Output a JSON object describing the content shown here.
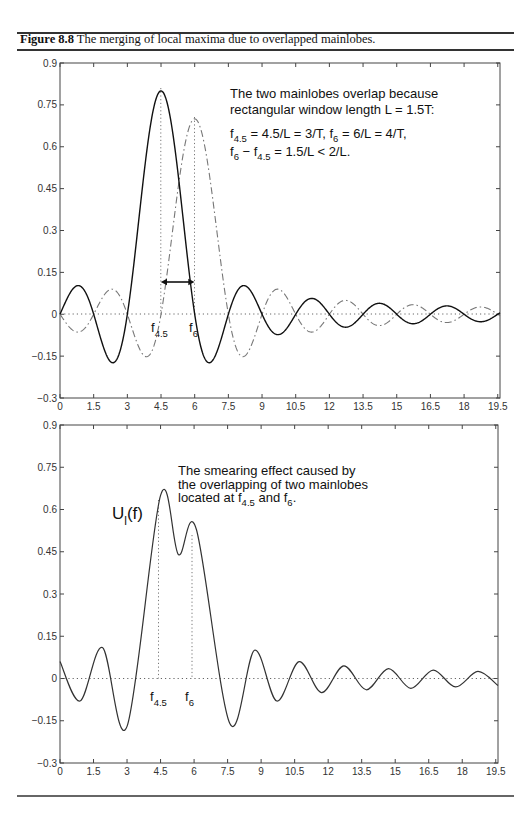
{
  "caption": {
    "label": "Figure 8.8",
    "text": " The merging of local maxima due to overlapped mainlobes."
  },
  "top_plot": {
    "annotation_lines": [
      "The two mainlobes overlap because",
      "rectangular window length L = 1.5T:"
    ],
    "eq1": {
      "a": "f",
      "a_sub": "4.5",
      "b": " = 4.5/L = 3/T, f",
      "b_sub": "6",
      "c": " = 6/L = 4/T,"
    },
    "eq2": {
      "a": "f",
      "a_sub": "6",
      "b": " − f",
      "b_sub": "4.5",
      "c": " = 1.5/L < 2/L."
    },
    "marker1": {
      "f": "f",
      "sub": "4.5"
    },
    "marker2": {
      "f": "f",
      "sub": "6"
    }
  },
  "bottom_plot": {
    "annotation_lines": [
      "The smearing effect caused by",
      "the overlapping of two mainlobes"
    ],
    "annotation_line3": {
      "a": "located at f",
      "a_sub": "4.5",
      "b": " and f",
      "b_sub": "6",
      "c": "."
    },
    "curve_label": {
      "u": "U",
      "sub": "l",
      "rest": "(f)"
    },
    "marker1": {
      "f": "f",
      "sub": "4.5"
    },
    "marker2": {
      "f": "f",
      "sub": "6"
    }
  },
  "chart_data": [
    {
      "type": "line",
      "title": "",
      "xlabel": "",
      "ylabel": "",
      "xlim": [
        0,
        19.6
      ],
      "ylim": [
        -0.3,
        0.9
      ],
      "xticks": [
        "0",
        "1.5",
        "3",
        "4.5",
        "6",
        "7.5",
        "9",
        "10.5",
        "12",
        "13.5",
        "15",
        "16.5",
        "18",
        "19.5"
      ],
      "yticks": [
        "-0.3",
        "-0.15",
        "0",
        "0.15",
        "0.3",
        "0.45",
        "0.6",
        "0.75",
        "0.9"
      ],
      "grid": false,
      "series": [
        {
          "name": "mainlobe at f4.5",
          "style": "solid",
          "center": 4.5,
          "peak": 0.8,
          "zero_spacing": 1.5,
          "notable_points": [
            [
              0,
              0.06
            ],
            [
              1.0,
              -0.07
            ],
            [
              2.0,
              0.1
            ],
            [
              3.0,
              -0.17
            ],
            [
              4.5,
              0.8
            ],
            [
              6.0,
              -0.17
            ],
            [
              7.0,
              0.1
            ],
            [
              8.0,
              -0.07
            ]
          ]
        },
        {
          "name": "mainlobe at f6",
          "style": "dash-dot",
          "center": 6.0,
          "peak": 0.7,
          "zero_spacing": 1.5,
          "notable_points": [
            [
              3.5,
              0.09
            ],
            [
              4.5,
              -0.15
            ],
            [
              6.0,
              0.7
            ],
            [
              7.5,
              -0.15
            ],
            [
              8.5,
              0.09
            ]
          ]
        }
      ],
      "annotations": [
        "The two mainlobes overlap because rectangular window length L = 1.5T:",
        "f4.5 = 4.5/L = 3/T, f6 = 6/L = 4/T,",
        "f6 - f4.5 = 1.5/L < 2/L."
      ]
    },
    {
      "type": "line",
      "title": "",
      "xlabel": "",
      "ylabel": "",
      "xlim": [
        0,
        19.6
      ],
      "ylim": [
        -0.3,
        0.9
      ],
      "xticks": [
        "0",
        "1.5",
        "3",
        "4.5",
        "6",
        "7.5",
        "9",
        "10.5",
        "12",
        "13.5",
        "15",
        "16.5",
        "18",
        "19.5"
      ],
      "yticks": [
        "-0.3",
        "-0.15",
        "0",
        "0.15",
        "0.3",
        "0.45",
        "0.6",
        "0.75",
        "0.9"
      ],
      "grid": false,
      "series": [
        {
          "name": "U_l(f)",
          "style": "solid",
          "points": [
            [
              0,
              0.06
            ],
            [
              0.9,
              -0.08
            ],
            [
              1.9,
              0.11
            ],
            [
              3.0,
              -0.17
            ],
            [
              4.5,
              0.65
            ],
            [
              5.3,
              0.44
            ],
            [
              6.1,
              0.53
            ],
            [
              7.6,
              -0.16
            ],
            [
              8.7,
              0.1
            ],
            [
              9.7,
              -0.08
            ],
            [
              10.7,
              0.06
            ],
            [
              11.7,
              -0.05
            ],
            [
              12.7,
              0.045
            ],
            [
              13.7,
              -0.04
            ],
            [
              14.7,
              0.035
            ],
            [
              15.7,
              -0.035
            ],
            [
              16.7,
              0.03
            ],
            [
              17.7,
              -0.03
            ],
            [
              18.7,
              0.025
            ],
            [
              19.6,
              -0.025
            ]
          ]
        }
      ],
      "annotations": [
        "The smearing effect caused by the overlapping of two mainlobes located at f4.5 and f6.",
        "U_l(f)"
      ]
    }
  ]
}
